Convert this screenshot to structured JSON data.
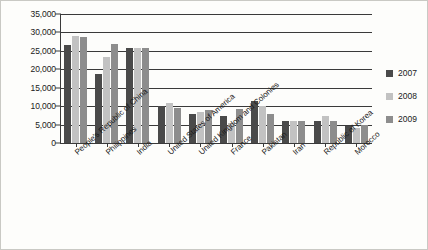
{
  "chart_data": {
    "type": "bar",
    "title": "",
    "subtitle": "",
    "xlabel": "",
    "ylabel": "",
    "ylim": [
      0,
      35000
    ],
    "ytick_labels": [
      "35,000",
      "30,000",
      "25,000",
      "20,000",
      "15,000",
      "10,000",
      "5,000",
      "0"
    ],
    "ytick_values": [
      35000,
      30000,
      25000,
      20000,
      15000,
      10000,
      5000,
      0
    ],
    "grid": true,
    "legend_position": "right",
    "categories": [
      "People's Republic of China",
      "Philippines",
      "India",
      "United States of America",
      "United Kingdom and Colonies",
      "France",
      "Pakistan",
      "Iran",
      "Republic of Korea",
      "Morocco"
    ],
    "series": [
      {
        "name": "2007",
        "color": "#4a4a4a",
        "values": [
          26700,
          18800,
          25800,
          10000,
          7900,
          7300,
          11500,
          6100,
          6000,
          4500
        ]
      },
      {
        "name": "2008",
        "color": "#c2c2c2",
        "values": [
          29000,
          23400,
          25700,
          10800,
          8500,
          5300,
          10000,
          5900,
          7300,
          4200
        ]
      },
      {
        "name": "2009",
        "color": "#8d8d8d",
        "values": [
          28800,
          27000,
          25700,
          9400,
          9000,
          9300,
          7800,
          6000,
          6000,
          4800
        ]
      }
    ]
  },
  "legend": {
    "items": [
      {
        "label": "2007",
        "key": "y2007"
      },
      {
        "label": "2008",
        "key": "y2008"
      },
      {
        "label": "2009",
        "key": "y2009"
      }
    ]
  }
}
